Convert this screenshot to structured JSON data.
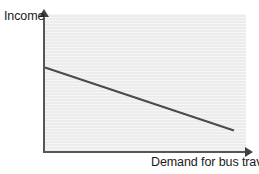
{
  "figure": {
    "width": 259,
    "height": 174,
    "background_color": "#ffffff",
    "panel_color": "#ececec",
    "axis_color": "#575757",
    "line_color": "#4a4a4a",
    "text_color": "#1b1b1b"
  },
  "chart_data": {
    "type": "line",
    "title": "",
    "subtitle": "",
    "xlabel": "Demand for bus travel",
    "ylabel": "Income",
    "xlim": [
      0,
      100
    ],
    "ylim": [
      0,
      100
    ],
    "grid": false,
    "legend": "none",
    "xticks": [],
    "yticks": [],
    "xticklabels": [],
    "yticklabels": [],
    "annotations": [],
    "series": [
      {
        "name": "Income vs demand for bus travel",
        "x": [
          0,
          94
        ],
        "y": [
          61,
          15
        ],
        "color": "#4a4a4a",
        "style": "solid",
        "width": 2,
        "relationship": "negative"
      }
    ]
  },
  "axes": {
    "y_axis_name": "y-axis-income",
    "x_axis_name": "x-axis-demand",
    "y_arrow": "up-arrow",
    "x_arrow": "right-arrow"
  }
}
